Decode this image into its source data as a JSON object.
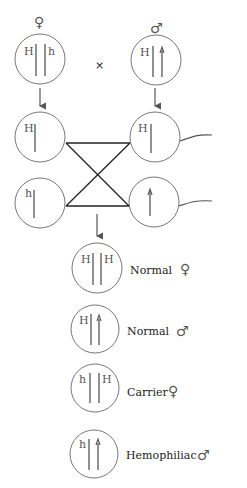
{
  "diagram": {
    "parents": {
      "female": {
        "symbol": "♀",
        "alleles": [
          "H",
          "h"
        ]
      },
      "cross_symbol": "×",
      "male": {
        "symbol": "♂",
        "alleles": [
          "H",
          ""
        ]
      }
    },
    "gametes": {
      "female": [
        {
          "allele": "H"
        },
        {
          "allele": "h"
        }
      ],
      "male": [
        {
          "allele": "H"
        },
        {
          "allele": ""
        }
      ]
    },
    "offspring": [
      {
        "alleles": [
          "H",
          "H"
        ],
        "label": "Normal",
        "sex_symbol": "♀"
      },
      {
        "alleles": [
          "H",
          ""
        ],
        "label": "Normal",
        "sex_symbol": "♂"
      },
      {
        "alleles": [
          "h",
          "H"
        ],
        "label": "Carrier",
        "sex_symbol": "♀"
      },
      {
        "alleles": [
          "h",
          ""
        ],
        "label": "Hemophiliac",
        "sex_symbol": "♂"
      }
    ],
    "colors": {
      "outline": "#777777",
      "lines": "#222222",
      "text": "#222222"
    }
  }
}
